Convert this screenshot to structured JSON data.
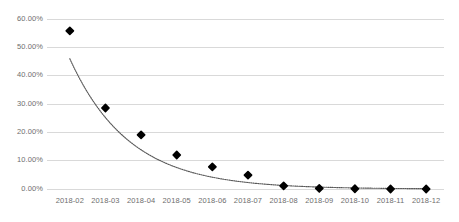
{
  "chart_data": {
    "type": "scatter",
    "title": "",
    "subtitle": "",
    "xlabel": "",
    "ylabel": "",
    "categories": [
      "2018-02",
      "2018-03",
      "2018-04",
      "2018-05",
      "2018-06",
      "2018-07",
      "2018-08",
      "2018-09",
      "2018-10",
      "2018-11",
      "2018-12"
    ],
    "series": [
      {
        "name": "",
        "marker": "diamond",
        "color": "#000000",
        "values": [
          0.558,
          0.286,
          0.191,
          0.12,
          0.078,
          0.049,
          0.011,
          0.002,
          0.001,
          0.0,
          0.0
        ]
      },
      {
        "name": "trendline",
        "type": "line",
        "style": "dotted",
        "color": "#595959",
        "values": [
          0.51,
          0.31,
          0.188,
          0.114,
          0.069,
          0.042,
          0.0255,
          0.0155,
          0.0094,
          0.0057,
          0.0
        ]
      }
    ],
    "ylim": [
      0.0,
      0.6
    ],
    "ytick_labels": [
      "60.00%",
      "50.00%",
      "40.00%",
      "30.00%",
      "20.00%",
      "10.00%",
      "0.00%"
    ],
    "ytick_values": [
      0.6,
      0.5,
      0.4,
      0.3,
      0.2,
      0.1,
      0.0
    ],
    "grid": {
      "horizontal": true,
      "vertical": false,
      "color": "#d9d9d9"
    },
    "legend": {
      "visible": false,
      "position": "none"
    },
    "axis_line_color": "#d9d9d9",
    "background": "#ffffff"
  }
}
